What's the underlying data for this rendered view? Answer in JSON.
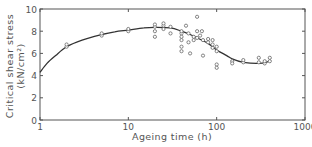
{
  "chart_data": {
    "type": "scatter",
    "title": "",
    "xlabel": "Ageing time (h)",
    "ylabel_line1": "Critical shear stress",
    "ylabel_line2": "(kN/cm²)",
    "xscale": "log",
    "xlim": [
      1,
      1000
    ],
    "ylim": [
      0,
      10
    ],
    "xticks": [
      1,
      10,
      100,
      1000
    ],
    "xtick_labels": [
      "1",
      "10",
      "100",
      "1000"
    ],
    "yticks": [
      0,
      2,
      4,
      6,
      8,
      10
    ],
    "ytick_labels": [
      "0",
      "2",
      "4",
      "6",
      "8",
      "10"
    ],
    "grid": false,
    "legend": null,
    "series": [
      {
        "name": "measurements",
        "kind": "scatter",
        "marker": "open-circle",
        "points": [
          [
            2,
            6.6
          ],
          [
            2,
            6.8
          ],
          [
            5,
            7.6
          ],
          [
            5,
            7.8
          ],
          [
            10,
            8.0
          ],
          [
            10,
            8.2
          ],
          [
            20,
            8.4
          ],
          [
            20,
            8.6
          ],
          [
            20,
            8.0
          ],
          [
            20,
            7.5
          ],
          [
            25,
            8.5
          ],
          [
            25,
            8.7
          ],
          [
            25,
            8.2
          ],
          [
            30,
            8.4
          ],
          [
            30,
            7.8
          ],
          [
            40,
            7.8
          ],
          [
            40,
            7.2
          ],
          [
            40,
            6.6
          ],
          [
            40,
            6.2
          ],
          [
            40,
            8.0
          ],
          [
            40,
            7.5
          ],
          [
            45,
            8.5
          ],
          [
            48,
            7.8
          ],
          [
            48,
            7.0
          ],
          [
            50,
            6.0
          ],
          [
            55,
            7.5
          ],
          [
            55,
            7.2
          ],
          [
            60,
            9.3
          ],
          [
            60,
            8.0
          ],
          [
            60,
            7.4
          ],
          [
            65,
            7.6
          ],
          [
            68,
            8.0
          ],
          [
            70,
            7.2
          ],
          [
            70,
            5.8
          ],
          [
            80,
            7.0
          ],
          [
            80,
            7.3
          ],
          [
            90,
            6.5
          ],
          [
            90,
            6.8
          ],
          [
            90,
            7.2
          ],
          [
            100,
            6.6
          ],
          [
            100,
            6.2
          ],
          [
            100,
            5.0
          ],
          [
            100,
            4.7
          ],
          [
            150,
            5.3
          ],
          [
            150,
            5.1
          ],
          [
            200,
            5.2
          ],
          [
            200,
            5.4
          ],
          [
            300,
            5.6
          ],
          [
            300,
            5.2
          ],
          [
            350,
            5.1
          ],
          [
            350,
            5.3
          ],
          [
            400,
            5.6
          ],
          [
            400,
            5.3
          ]
        ]
      },
      {
        "name": "fitted curve",
        "kind": "line",
        "points": [
          [
            1,
            4.3
          ],
          [
            1.2,
            5.1
          ],
          [
            1.5,
            5.8
          ],
          [
            2,
            6.6
          ],
          [
            3,
            7.2
          ],
          [
            5,
            7.7
          ],
          [
            7,
            7.95
          ],
          [
            10,
            8.1
          ],
          [
            15,
            8.3
          ],
          [
            20,
            8.35
          ],
          [
            30,
            8.3
          ],
          [
            40,
            8.0
          ],
          [
            50,
            7.7
          ],
          [
            60,
            7.4
          ],
          [
            80,
            6.9
          ],
          [
            100,
            6.3
          ],
          [
            130,
            5.8
          ],
          [
            150,
            5.5
          ],
          [
            200,
            5.2
          ],
          [
            300,
            5.1
          ],
          [
            400,
            5.3
          ]
        ]
      }
    ]
  },
  "style": {
    "axis_color": "#555555",
    "line_color": "#333333",
    "marker_color": "#666666"
  }
}
